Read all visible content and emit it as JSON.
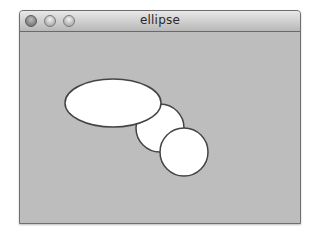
{
  "window": {
    "title": "ellipse",
    "controls": [
      "close",
      "minimize",
      "zoom"
    ]
  },
  "canvas": {
    "background": "#bdbdbd",
    "shapes": [
      {
        "type": "ellipse",
        "cx": 113,
        "cy": 103,
        "rx": 48,
        "ry": 24,
        "fill": "#ffffff",
        "stroke": "#444444"
      },
      {
        "type": "circle",
        "cx": 160,
        "cy": 128,
        "r": 24,
        "fill": "#ffffff",
        "stroke": "#444444"
      },
      {
        "type": "circle",
        "cx": 184,
        "cy": 152,
        "r": 24,
        "fill": "#ffffff",
        "stroke": "#444444"
      }
    ]
  }
}
